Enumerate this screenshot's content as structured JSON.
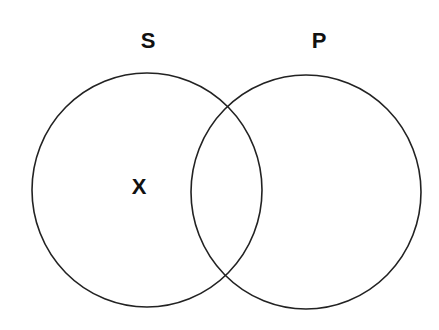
{
  "diagram": {
    "type": "venn",
    "sets": [
      {
        "id": "S",
        "label": "S",
        "label_pos": [
          148,
          41
        ],
        "circle": {
          "cx": 147,
          "cy": 190,
          "rx": 115,
          "ry": 117
        }
      },
      {
        "id": "P",
        "label": "P",
        "label_pos": [
          319,
          41
        ],
        "circle": {
          "cx": 306,
          "cy": 192,
          "rx": 115,
          "ry": 117
        }
      }
    ],
    "marks": [
      {
        "label": "X",
        "region": "S only",
        "pos": [
          139,
          187
        ]
      }
    ],
    "stroke_color": "#222222",
    "background": "#ffffff"
  }
}
